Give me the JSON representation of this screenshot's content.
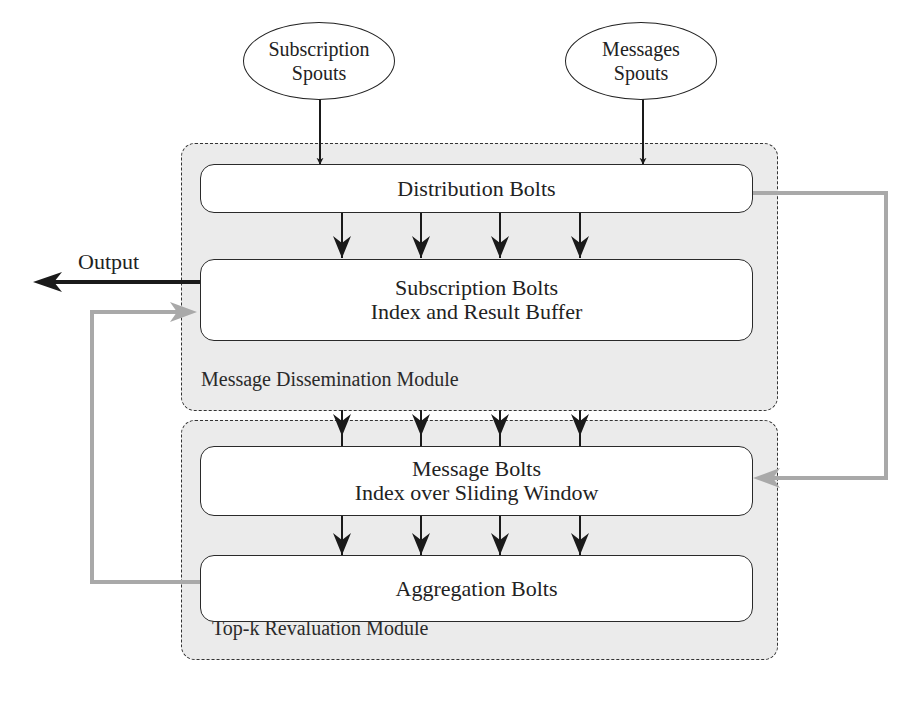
{
  "spouts": [
    {
      "id": "subscription",
      "line1": "Subscription",
      "line2": "Spouts"
    },
    {
      "id": "messages",
      "line1": "Messages",
      "line2": "Spouts"
    }
  ],
  "modules": [
    {
      "id": "dissemination",
      "label": "Message Dissemination Module"
    },
    {
      "id": "revaluation",
      "label": "Top-k Revaluation Module"
    }
  ],
  "bolts": {
    "distribution": {
      "line1": "Distribution Bolts"
    },
    "subscription": {
      "line1": "Subscription Bolts",
      "line2": "Index and Result Buffer"
    },
    "message": {
      "line1": "Message Bolts",
      "line2": "Index over Sliding Window"
    },
    "aggregation": {
      "line1": "Aggregation Bolts"
    }
  },
  "output": {
    "label": "Output"
  },
  "colors": {
    "module_fill": "#ebebeb",
    "black_arrow": "#1a1a1a",
    "grey_arrow": "#a9a9a9"
  }
}
